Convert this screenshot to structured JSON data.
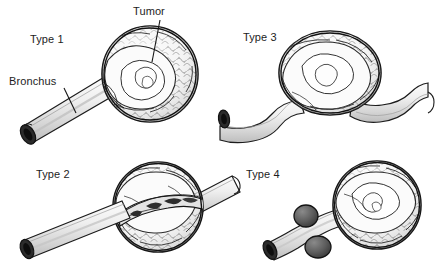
{
  "figure": {
    "background_color": "#ffffff",
    "ink_color": "#1a1a1a",
    "tumor_fill": "#f2f2f2",
    "bronchus_fill": "#e9e9e9",
    "lumen_color": "#2b2b2b",
    "nodule_fill": "#595959"
  },
  "labels": {
    "type1": "Type 1",
    "type2": "Type 2",
    "type3": "Type 3",
    "type4": "Type 4",
    "tumor": "Tumor",
    "bronchus": "Bronchus"
  },
  "panels": [
    {
      "id": "type-1",
      "label": "Type 1",
      "quadrant": "top-left",
      "callouts": [
        "Tumor",
        "Bronchus"
      ],
      "tumor_count": 1,
      "nodule_count": 0,
      "bronchus_shape": "straight",
      "relationship": "polypoid tumor mass at the terminal end of a straight bronchus"
    },
    {
      "id": "type-3",
      "label": "Type 3",
      "quadrant": "top-right",
      "callouts": [],
      "tumor_count": 1,
      "nodule_count": 0,
      "bronchus_shape": "wavy",
      "relationship": "tumor seated on top of an undulating bronchus, compressing it from outside"
    },
    {
      "id": "type-2",
      "label": "Type 2",
      "quadrant": "bottom-left",
      "callouts": [],
      "tumor_count": 1,
      "nodule_count": 0,
      "bronchus_shape": "straight-through",
      "relationship": "bronchus passes through the tumor, cut-away shows intraluminal invasion"
    },
    {
      "id": "type-4",
      "label": "Type 4",
      "quadrant": "bottom-right",
      "callouts": [],
      "tumor_count": 1,
      "nodule_count": 2,
      "bronchus_shape": "straight",
      "relationship": "terminal tumor mass with two satellite nodules on the bronchial wall"
    }
  ]
}
